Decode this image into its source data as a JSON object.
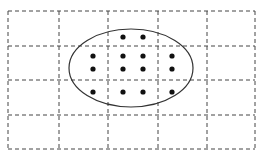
{
  "diagram": {
    "grid": {
      "x": [
        8,
        59,
        108,
        158,
        207,
        255
      ],
      "y": [
        11,
        46,
        80,
        115,
        149
      ],
      "columns": 5,
      "rows": 4,
      "stroke": "#444444",
      "dash": "4 3"
    },
    "ellipse": {
      "cx": 131,
      "cy": 68,
      "rx": 62,
      "ry": 39,
      "stroke": "#333333"
    },
    "dots": [
      {
        "x": 123,
        "y": 37
      },
      {
        "x": 143,
        "y": 37
      },
      {
        "x": 93,
        "y": 56
      },
      {
        "x": 123,
        "y": 56
      },
      {
        "x": 143,
        "y": 56
      },
      {
        "x": 172,
        "y": 56
      },
      {
        "x": 93,
        "y": 69
      },
      {
        "x": 123,
        "y": 69
      },
      {
        "x": 143,
        "y": 69
      },
      {
        "x": 172,
        "y": 69
      },
      {
        "x": 93,
        "y": 92
      },
      {
        "x": 123,
        "y": 92
      },
      {
        "x": 143,
        "y": 92
      },
      {
        "x": 172,
        "y": 92
      }
    ],
    "dot_radius": 2.6,
    "dot_color": "#111111",
    "dot_count": 14
  }
}
